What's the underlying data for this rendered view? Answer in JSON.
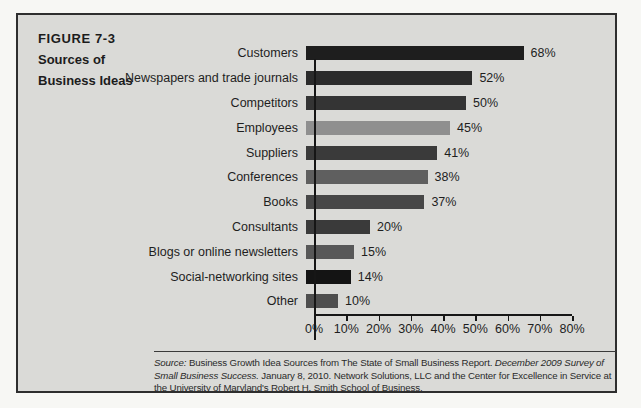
{
  "figure": {
    "label": "FIGURE 7-3",
    "title_line1": "Sources of",
    "title_line2": "Business Ideas"
  },
  "chart_data": {
    "type": "bar",
    "orientation": "horizontal",
    "title": "Sources of Business Ideas",
    "xlabel": "",
    "ylabel": "",
    "xlim": [
      0,
      80
    ],
    "grid": false,
    "legend": false,
    "categories": [
      "Customers",
      "Newspapers and trade journals",
      "Competitors",
      "Employees",
      "Suppliers",
      "Conferences",
      "Books",
      "Consultants",
      "Blogs or online newsletters",
      "Social-networking sites",
      "Other"
    ],
    "values": [
      68,
      52,
      50,
      45,
      41,
      38,
      37,
      20,
      15,
      14,
      10
    ],
    "value_labels": [
      "68%",
      "52%",
      "50%",
      "45%",
      "41%",
      "38%",
      "37%",
      "20%",
      "15%",
      "14%",
      "10%"
    ],
    "bar_colors": [
      "#1e1e1e",
      "#2b2b2b",
      "#343434",
      "#8f8f8f",
      "#3a3a3a",
      "#5f5f5f",
      "#474747",
      "#3a3a3a",
      "#585858",
      "#141414",
      "#4e4e4e"
    ],
    "x_ticks": [
      "0%",
      "10%",
      "20%",
      "30%",
      "40%",
      "50%",
      "60%",
      "70%",
      "80%"
    ]
  },
  "source_note": {
    "segments": [
      {
        "text": "Source:",
        "italic": true
      },
      {
        "text": " Business Growth Idea Sources from The State of Small Business Report. ",
        "italic": false
      },
      {
        "text": "December 2009 Survey of Small Business Success.",
        "italic": true
      },
      {
        "text": " January 8, 2010. Network Solutions, LLC and the Center for Excellence in Service at the University of Maryland's Robert H. Smith School of Business.",
        "italic": false
      }
    ]
  },
  "colors": {
    "panel_background": "#dadad7",
    "page_background": "#f7f7f4",
    "panel_border": "#2e2e2e",
    "axis": "#161616",
    "text": "#1e1e1e"
  }
}
